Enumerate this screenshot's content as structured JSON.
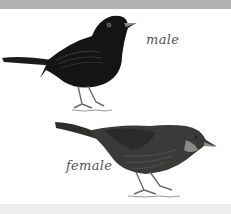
{
  "labels": {
    "male": "male",
    "female": "female"
  },
  "colors": {
    "top_bar": "#b3b3b3",
    "bottom_band": "#ededed",
    "male_body": "#141414",
    "female_body": "#3a3a38",
    "beak": "#8a8a8a",
    "legs": "#6a6a6a"
  },
  "figures": [
    {
      "name": "male-blackbird",
      "label": "male"
    },
    {
      "name": "female-blackbird",
      "label": "female"
    }
  ]
}
